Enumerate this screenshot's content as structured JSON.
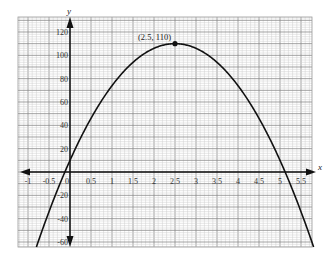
{
  "chart_data": {
    "type": "line",
    "title": "",
    "xlabel": "x",
    "ylabel": "y",
    "function": "y = -16x^2 + 80x + 10",
    "xlim": [
      -1.24,
      5.76
    ],
    "ylim": [
      -64,
      133
    ],
    "grid": true,
    "legend": null,
    "x_ticks": [
      -1,
      -0.5,
      0,
      0.5,
      1,
      1.5,
      2,
      2.5,
      3,
      3.5,
      4,
      4.5,
      5,
      5.5
    ],
    "x_tick_labels": [
      "-1",
      "-0.5",
      "0",
      "0.5",
      "1",
      "1.5",
      "2",
      "2.5",
      "3",
      "3.5",
      "4",
      "4.5",
      "5",
      "5.5"
    ],
    "y_ticks": [
      120,
      100,
      80,
      60,
      40,
      20,
      -20,
      -40,
      -60
    ],
    "y_tick_labels": [
      "120",
      "100",
      "80",
      "60",
      "40",
      "20",
      "-20",
      "-40",
      "-60"
    ],
    "series": [
      {
        "name": "parabola",
        "x": [
          -0.8,
          -0.5,
          -0.12,
          0,
          0.5,
          1,
          1.5,
          2,
          2.5,
          3,
          3.5,
          4,
          4.5,
          5,
          5.12,
          5.5,
          5.8
        ],
        "y": [
          -64.2,
          -34,
          0,
          10,
          46,
          74,
          94,
          106,
          110,
          106,
          94,
          74,
          46,
          10,
          0,
          -34,
          -64.2
        ]
      }
    ],
    "annotations": [
      {
        "text": "(2.5, 110)",
        "x": 2.5,
        "y": 110,
        "marker": "dot"
      }
    ]
  },
  "labels": {
    "x_axis": "x",
    "y_axis": "y",
    "vertex": "(2.5, 110)"
  }
}
